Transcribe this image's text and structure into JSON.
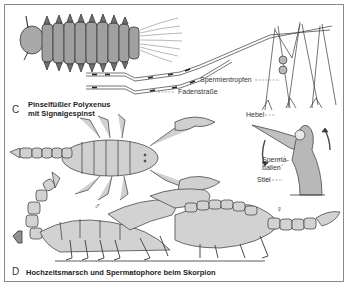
{
  "figure": {
    "panel_c": {
      "letter": "C",
      "title_line1": "Pinselfüßler Polyxenus",
      "title_line2": "mit Signalgespinst",
      "labels": {
        "sperm_drops": "Spermientropfen",
        "thread_road": "Fadenstraße"
      }
    },
    "panel_d": {
      "letter": "D",
      "title": "Hochzeitsmarsch und Spermatophore beim Skorpion",
      "labels": {
        "lever": "Hebel",
        "sperm_balls_1": "Sperma-",
        "sperm_balls_2": "ballen",
        "stalk": "Stiel"
      },
      "symbols": {
        "male": "♂",
        "female": "♀"
      }
    },
    "colors": {
      "fill": "#c8c8c8",
      "fill_light": "#dedede",
      "outline": "#4a4a4a",
      "frame": "#8a8a8a"
    }
  }
}
